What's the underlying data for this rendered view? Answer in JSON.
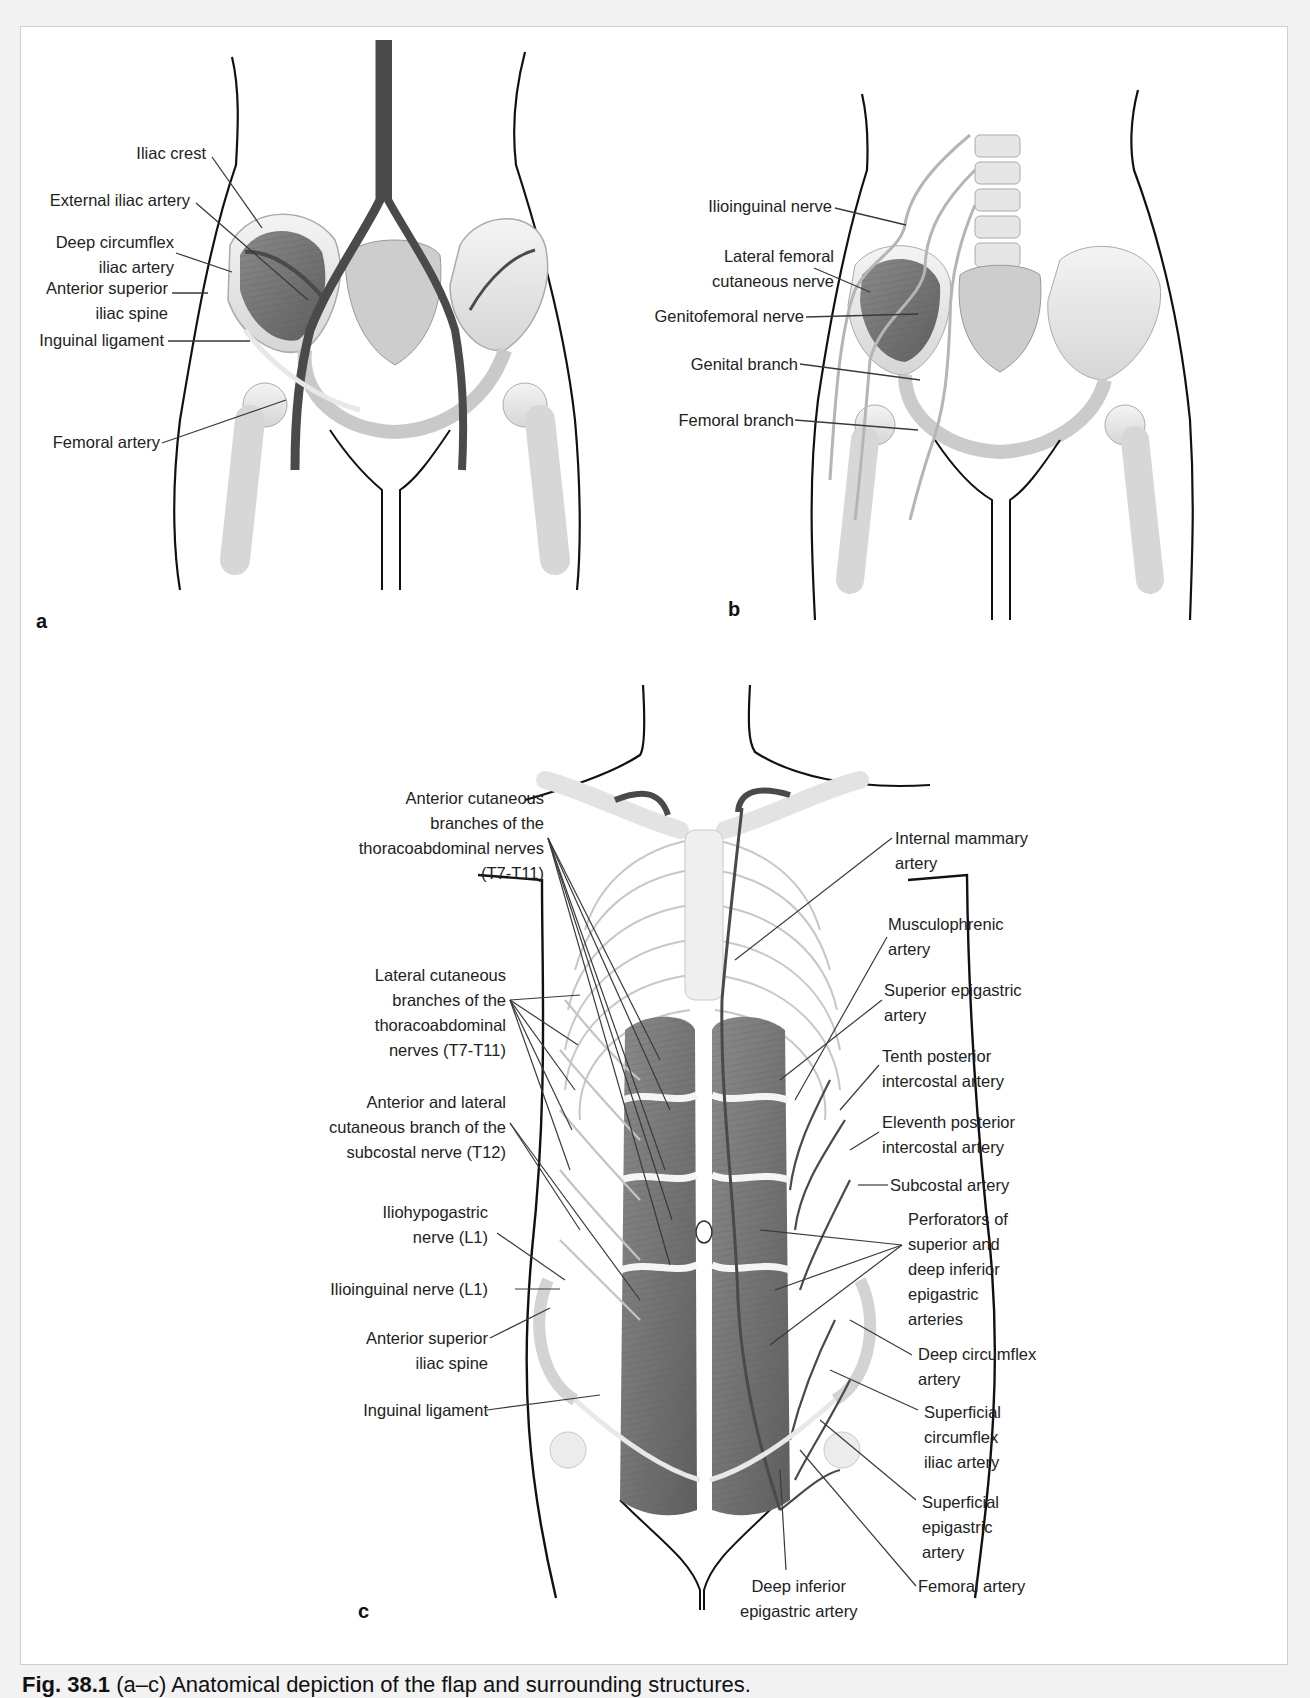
{
  "figure": {
    "caption_label": "Fig. 38.1",
    "caption_text": "(a–c) Anatomical depiction of the flap and surrounding structures.",
    "colors": {
      "background": "#f2f2f2",
      "frame": "#ffffff",
      "outline": "#111111",
      "bone_fill": "#ececec",
      "muscle_fill": "#7a7a7a",
      "vessel": "#4a4a4a",
      "nerve": "#bdbdbd",
      "leader": "#3a3a3a",
      "text": "#222222"
    }
  },
  "panel_a": {
    "letter": "a",
    "labels": [
      "Iliac crest",
      "External iliac artery",
      "Deep circumflex\niliac artery",
      "Anterior superior\niliac spine",
      "Inguinal ligament",
      "Femoral artery"
    ]
  },
  "panel_b": {
    "letter": "b",
    "labels": [
      "Ilioinguinal nerve",
      "Lateral femoral\ncutaneous nerve",
      "Genitofemoral nerve",
      "Genital branch",
      "Femoral branch"
    ]
  },
  "panel_c": {
    "letter": "c",
    "left_labels": [
      "Anterior cutaneous\nbranches of the\nthoracoabdominal nerves\n(T7-T11)",
      "Lateral cutaneous\nbranches of the\nthoracoabdominal\nnerves (T7-T11)",
      "Anterior and lateral\ncutaneous branch of the\nsubcostal nerve (T12)",
      "Iliohypogastric\nnerve (L1)",
      "Ilioinguinal nerve (L1)",
      "Anterior superior\niliac spine",
      "Inguinal ligament"
    ],
    "right_labels": [
      "Internal mammary\nartery",
      "Musculophrenic\nartery",
      "Superior epigastric\nartery",
      "Tenth posterior\nintercostal artery",
      "Eleventh posterior\nintercostal artery",
      "Subcostal artery",
      "Perforators of\nsuperior and\ndeep inferior\nepigastric\narteries",
      "Deep circumflex\nartery",
      "Superficial\ncircumflex\niliac artery",
      "Superficial\nepigastric\nartery",
      "Femoral artery"
    ],
    "bottom_labels": [
      "Deep inferior\nepigastric artery"
    ]
  }
}
